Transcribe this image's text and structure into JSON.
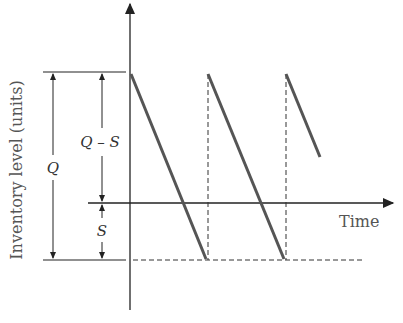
{
  "diagram": {
    "title": "",
    "y_axis_label": "Inventory level (units)",
    "x_axis_label": "Time",
    "dimensions": {
      "Q": "Q",
      "Q_minus_S": "Q – S",
      "S": "S"
    },
    "colors": {
      "inventory_line": "#555555",
      "axis": "#222222",
      "dashed": "#333333"
    },
    "series": {
      "name": "Inventory sawtooth",
      "segments": [
        {
          "from": [
            130,
            72
          ],
          "to": [
            207,
            260
          ]
        },
        {
          "from": [
            207,
            72
          ],
          "to": [
            285,
            260
          ]
        },
        {
          "from": [
            285,
            72
          ],
          "to": [
            320,
            157
          ]
        }
      ]
    }
  }
}
